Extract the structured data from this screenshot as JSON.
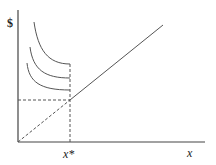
{
  "diagram": {
    "y_axis_label": "$",
    "x_axis_label": "x",
    "x_star_label": "x*",
    "elements": {
      "indifference_curves": 3,
      "diagonal_line": "linear function from origin",
      "dashed_guides": [
        "horizontal at intersection",
        "vertical at x*"
      ]
    },
    "colors": {
      "line": "#555555",
      "axis": "#444444",
      "background": "#ffffff"
    }
  }
}
